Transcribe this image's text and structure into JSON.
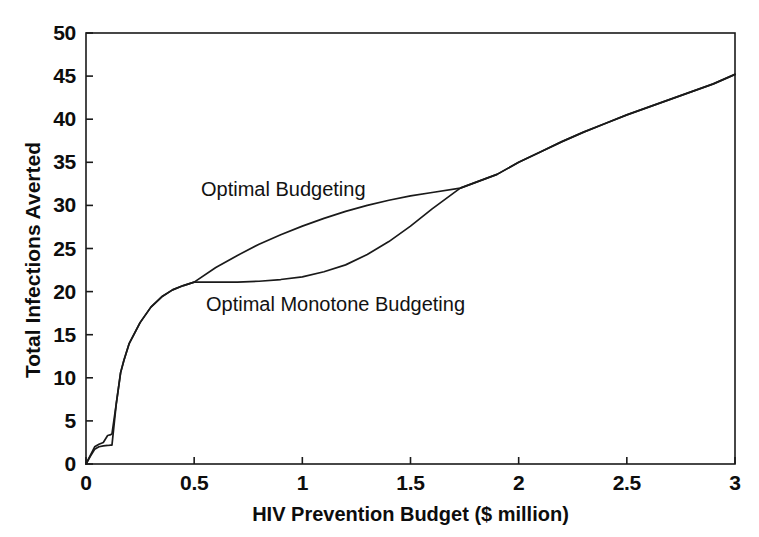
{
  "chart_data": {
    "type": "line",
    "title": "",
    "xlabel": "HIV Prevention Budget ($ million)",
    "ylabel": "Total Infections Averted",
    "xlim": [
      0,
      3
    ],
    "ylim": [
      0,
      50
    ],
    "xticks": [
      "0",
      "0.5",
      "1",
      "1.5",
      "2",
      "2.5",
      "3"
    ],
    "xtick_values": [
      0,
      0.5,
      1,
      1.5,
      2,
      2.5,
      3
    ],
    "yticks": [
      "0",
      "5",
      "10",
      "15",
      "20",
      "25",
      "30",
      "35",
      "40",
      "45",
      "50"
    ],
    "ytick_values": [
      0,
      5,
      10,
      15,
      20,
      25,
      30,
      35,
      40,
      45,
      50
    ],
    "grid": false,
    "legend_position": "inline-annotations",
    "frame": "box",
    "line_color": "#1a1a1a",
    "background_color": "#ffffff",
    "annotations": [
      {
        "text": "Optimal Budgeting",
        "x": 0.49,
        "y": 31.7
      },
      {
        "text": "Optimal Monotone Budgeting",
        "x": 0.55,
        "y": 18.5
      }
    ],
    "series": [
      {
        "name": "Optimal Budgeting",
        "points": [
          [
            0.0,
            0.0
          ],
          [
            0.02,
            1.0
          ],
          [
            0.04,
            2.0
          ],
          [
            0.06,
            2.3
          ],
          [
            0.08,
            2.5
          ],
          [
            0.1,
            3.3
          ],
          [
            0.115,
            3.4
          ],
          [
            0.12,
            3.5
          ],
          [
            0.14,
            7.0
          ],
          [
            0.16,
            10.6
          ],
          [
            0.175,
            12.0
          ],
          [
            0.2,
            14.0
          ],
          [
            0.25,
            16.4
          ],
          [
            0.3,
            18.2
          ],
          [
            0.35,
            19.4
          ],
          [
            0.4,
            20.2
          ],
          [
            0.45,
            20.7
          ],
          [
            0.5,
            21.1
          ],
          [
            0.6,
            22.8
          ],
          [
            0.7,
            24.2
          ],
          [
            0.8,
            25.5
          ],
          [
            0.9,
            26.6
          ],
          [
            1.0,
            27.6
          ],
          [
            1.1,
            28.5
          ],
          [
            1.2,
            29.3
          ],
          [
            1.3,
            30.0
          ],
          [
            1.4,
            30.6
          ],
          [
            1.5,
            31.1
          ],
          [
            1.6,
            31.5
          ],
          [
            1.73,
            32.0
          ],
          [
            1.9,
            33.6
          ],
          [
            2.0,
            35.0
          ],
          [
            2.1,
            36.2
          ],
          [
            2.2,
            37.4
          ],
          [
            2.3,
            38.5
          ],
          [
            2.4,
            39.5
          ],
          [
            2.5,
            40.5
          ],
          [
            2.6,
            41.4
          ],
          [
            2.7,
            42.3
          ],
          [
            2.8,
            43.2
          ],
          [
            2.9,
            44.1
          ],
          [
            3.0,
            45.2
          ]
        ]
      },
      {
        "name": "Optimal Monotone Budgeting",
        "points": [
          [
            0.0,
            0.0
          ],
          [
            0.02,
            0.9
          ],
          [
            0.04,
            1.7
          ],
          [
            0.06,
            2.0
          ],
          [
            0.08,
            2.1
          ],
          [
            0.1,
            2.15
          ],
          [
            0.115,
            2.2
          ],
          [
            0.12,
            2.2
          ],
          [
            0.14,
            7.0
          ],
          [
            0.16,
            10.6
          ],
          [
            0.175,
            12.0
          ],
          [
            0.2,
            14.0
          ],
          [
            0.25,
            16.4
          ],
          [
            0.3,
            18.2
          ],
          [
            0.35,
            19.4
          ],
          [
            0.4,
            20.2
          ],
          [
            0.45,
            20.7
          ],
          [
            0.5,
            21.1
          ],
          [
            0.6,
            21.1
          ],
          [
            0.7,
            21.1
          ],
          [
            0.8,
            21.2
          ],
          [
            0.9,
            21.4
          ],
          [
            1.0,
            21.7
          ],
          [
            1.1,
            22.3
          ],
          [
            1.2,
            23.1
          ],
          [
            1.3,
            24.3
          ],
          [
            1.4,
            25.8
          ],
          [
            1.5,
            27.6
          ],
          [
            1.6,
            29.6
          ],
          [
            1.73,
            32.0
          ],
          [
            1.9,
            33.6
          ],
          [
            2.0,
            35.0
          ],
          [
            2.1,
            36.2
          ],
          [
            2.2,
            37.4
          ],
          [
            2.3,
            38.5
          ],
          [
            2.4,
            39.5
          ],
          [
            2.5,
            40.5
          ],
          [
            2.6,
            41.4
          ],
          [
            2.7,
            42.3
          ],
          [
            2.8,
            43.2
          ],
          [
            2.9,
            44.1
          ],
          [
            3.0,
            45.2
          ]
        ]
      }
    ]
  }
}
